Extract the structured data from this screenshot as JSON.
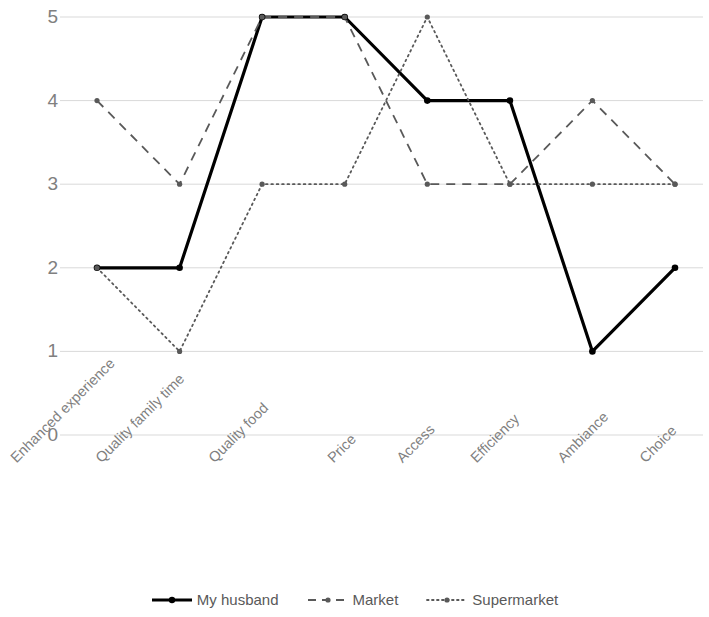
{
  "chart_data": {
    "type": "line",
    "title": "",
    "xlabel": "",
    "ylabel": "",
    "ylim": [
      0,
      5
    ],
    "yticks": [
      0,
      1,
      2,
      3,
      4,
      5
    ],
    "ytick_labels": [
      "0",
      "1",
      "2",
      "3",
      "4",
      "5"
    ],
    "grid": true,
    "legend_position": "bottom",
    "categories": [
      "Enhanced experience",
      "Quality family time",
      "Quality food",
      "Price",
      "Access",
      "Efficiency",
      "Ambiance",
      "Choice"
    ],
    "series": [
      {
        "name": "My husband",
        "style": "solid",
        "color": "#000000",
        "width": 3.2,
        "marker": "circle",
        "values": [
          2,
          2,
          5,
          5,
          4,
          4,
          1,
          2
        ]
      },
      {
        "name": "Market",
        "style": "dashed",
        "color": "#595959",
        "width": 1.8,
        "marker": "circle",
        "values": [
          4,
          3,
          5,
          5,
          3,
          3,
          4,
          3
        ]
      },
      {
        "name": "Supermarket",
        "style": "dotted",
        "color": "#595959",
        "width": 1.8,
        "marker": "circle",
        "values": [
          2,
          1,
          3,
          3,
          5,
          3,
          3,
          3
        ]
      }
    ]
  },
  "axis": {
    "gridline_color": "#d9d9d9"
  }
}
